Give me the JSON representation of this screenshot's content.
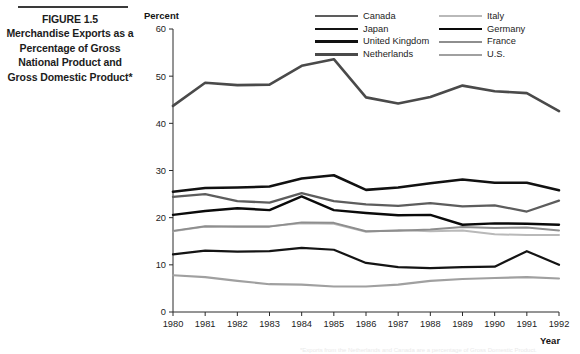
{
  "figure": {
    "number": "FIGURE 1.5",
    "caption": "Merchandise Exports as a Percentage of Gross National Product and Gross Domestic Product*",
    "footnote": "*Exports from the Netherlands and Canada are a percentage of Gross Domestic Product."
  },
  "axes": {
    "y_title": "Percent",
    "x_title": "Year",
    "y_ticks": [
      "0",
      "10",
      "20",
      "30",
      "40",
      "50",
      "60"
    ],
    "x_ticks": [
      "1980",
      "1981",
      "1982",
      "1983",
      "1984",
      "1985",
      "1986",
      "1987",
      "1988",
      "1989",
      "1990",
      "1991",
      "1992"
    ]
  },
  "legend": {
    "left_column": [
      "Canada",
      "Japan",
      "United Kingdom",
      "Netherlands"
    ],
    "right_column": [
      "Italy",
      "Germany",
      "France",
      "U.S."
    ]
  },
  "chart_data": {
    "type": "line",
    "title": "Merchandise Exports as a Percentage of Gross National Product and Gross Domestic Product*",
    "xlabel": "Year",
    "ylabel": "Percent",
    "xlim": [
      1980,
      1992
    ],
    "ylim": [
      0,
      60
    ],
    "ytick_step": 10,
    "grid": false,
    "legend_position": "top-right",
    "x": [
      1980,
      1981,
      1982,
      1983,
      1984,
      1985,
      1986,
      1987,
      1988,
      1989,
      1990,
      1991,
      1992
    ],
    "series": [
      {
        "name": "Netherlands",
        "color": "#4a4a4a",
        "width": 2.6,
        "values": [
          43.7,
          48.6,
          48.1,
          48.2,
          52.2,
          53.6,
          45.5,
          44.2,
          45.6,
          48.0,
          46.8,
          46.4,
          42.6
        ]
      },
      {
        "name": "Canada",
        "color": "#5d5d5d",
        "width": 2.3,
        "values": [
          24.4,
          25.0,
          23.5,
          23.2,
          25.2,
          23.5,
          22.8,
          22.5,
          23.1,
          22.4,
          22.6,
          21.3,
          23.6
        ]
      },
      {
        "name": "United Kingdom",
        "color": "#111111",
        "width": 2.6,
        "values": [
          25.5,
          26.3,
          26.4,
          26.6,
          28.3,
          29.0,
          25.9,
          26.4,
          27.3,
          28.1,
          27.4,
          27.4,
          25.8
        ]
      },
      {
        "name": "Germany",
        "color": "#0a0a0a",
        "width": 2.4,
        "values": [
          20.6,
          21.4,
          22.0,
          21.6,
          24.5,
          21.6,
          21.0,
          20.5,
          20.6,
          18.5,
          18.8,
          18.7,
          18.5
        ]
      },
      {
        "name": "Italy",
        "color": "#b9b9b9",
        "width": 2.0,
        "values": [
          17.1,
          18.1,
          18.2,
          18.2,
          18.8,
          18.7,
          17.0,
          17.4,
          17.1,
          17.3,
          16.5,
          16.3,
          16.3
        ]
      },
      {
        "name": "France",
        "color": "#8e8e8e",
        "width": 2.0,
        "values": [
          17.2,
          18.2,
          18.1,
          18.1,
          19.0,
          18.9,
          17.1,
          17.2,
          17.5,
          18.0,
          17.8,
          17.9,
          17.3
        ]
      },
      {
        "name": "Japan",
        "color": "#141414",
        "width": 2.2,
        "values": [
          12.2,
          13.0,
          12.8,
          12.9,
          13.6,
          13.2,
          10.4,
          9.5,
          9.3,
          9.5,
          9.6,
          12.9,
          10.0
        ]
      },
      {
        "name": "U.S.",
        "color": "#a0a0a0",
        "width": 2.1,
        "values": [
          7.8,
          7.4,
          6.6,
          5.9,
          5.8,
          5.4,
          5.4,
          5.8,
          6.6,
          7.0,
          7.2,
          7.4,
          7.1
        ]
      }
    ]
  }
}
